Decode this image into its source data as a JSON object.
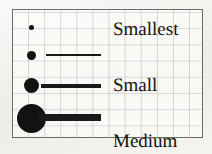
{
  "legend": {
    "title": "",
    "frame_color": "#6a6a66",
    "symbol_color": "#121210",
    "grid_color": "#7a8296",
    "paper_color": "#f3f2ef",
    "classes": [
      {
        "label": "Smallest",
        "symbol": "circle",
        "circle_diameter_px": 5,
        "line_length_px": 0,
        "line_thickness_px": 0
      },
      {
        "label": "Small",
        "symbol": "circle-with-line",
        "circle_diameter_px": 9,
        "line_length_px": 55,
        "line_thickness_px": 2
      },
      {
        "label": "Medium",
        "symbol": "circle-with-line",
        "circle_diameter_px": 15,
        "line_length_px": 60,
        "line_thickness_px": 4
      },
      {
        "label": "Large",
        "symbol": "circle-with-line",
        "circle_diameter_px": 29,
        "line_length_px": 62,
        "line_thickness_px": 7
      }
    ]
  }
}
